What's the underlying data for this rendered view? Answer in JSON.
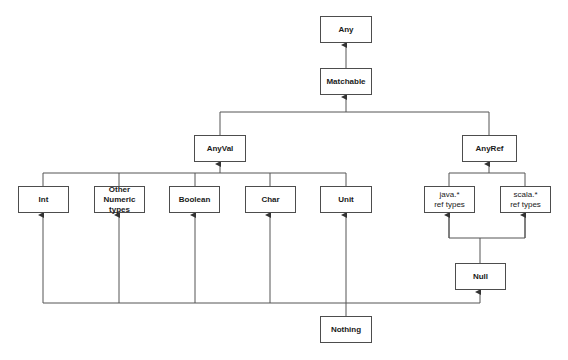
{
  "diagram": {
    "colors": {
      "line": "#555555",
      "border": "#4d4d4d",
      "text": "#1a1a1a",
      "background": "#ffffff"
    },
    "nodes": {
      "any": {
        "label": "Any",
        "x": 320,
        "y": 16,
        "w": 52,
        "h": 27
      },
      "matchable": {
        "label": "Matchable",
        "x": 320,
        "y": 68,
        "w": 52,
        "h": 27
      },
      "anyval": {
        "label": "AnyVal",
        "x": 194,
        "y": 135,
        "w": 52,
        "h": 27
      },
      "anyref": {
        "label": "AnyRef",
        "x": 462,
        "y": 135,
        "w": 55,
        "h": 27
      },
      "int": {
        "label": "Int",
        "x": 18,
        "y": 186,
        "w": 51,
        "h": 27
      },
      "other_numeric": {
        "label": "Other\nNumeric\ntypes",
        "x": 94,
        "y": 186,
        "w": 51,
        "h": 27
      },
      "boolean": {
        "label": "Boolean",
        "x": 169,
        "y": 186,
        "w": 51,
        "h": 27
      },
      "char": {
        "label": "Char",
        "x": 245,
        "y": 186,
        "w": 51,
        "h": 27
      },
      "unit": {
        "label": "Unit",
        "x": 320,
        "y": 186,
        "w": 52,
        "h": 27
      },
      "java_ref": {
        "label": "java.*\nref types",
        "x": 424,
        "y": 186,
        "w": 51,
        "h": 27
      },
      "scala_ref": {
        "label": "scala.*\nref types",
        "x": 500,
        "y": 186,
        "w": 51,
        "h": 27
      },
      "null": {
        "label": "Null",
        "x": 455,
        "y": 263,
        "w": 51,
        "h": 27
      },
      "nothing": {
        "label": "Nothing",
        "x": 320,
        "y": 316,
        "w": 52,
        "h": 27
      }
    },
    "edges": [
      {
        "from": "Matchable",
        "to": "Any"
      },
      {
        "from": "AnyVal",
        "to": "Matchable"
      },
      {
        "from": "AnyRef",
        "to": "Matchable"
      },
      {
        "from": "Int",
        "to": "AnyVal"
      },
      {
        "from": "Other Numeric types",
        "to": "AnyVal"
      },
      {
        "from": "Boolean",
        "to": "AnyVal"
      },
      {
        "from": "Char",
        "to": "AnyVal"
      },
      {
        "from": "Unit",
        "to": "AnyVal"
      },
      {
        "from": "java.* ref types",
        "to": "AnyRef"
      },
      {
        "from": "scala.* ref types",
        "to": "AnyRef"
      },
      {
        "from": "Null",
        "to": "java.* ref types"
      },
      {
        "from": "Null",
        "to": "scala.* ref types"
      },
      {
        "from": "Nothing",
        "to": "Int"
      },
      {
        "from": "Nothing",
        "to": "Other Numeric types"
      },
      {
        "from": "Nothing",
        "to": "Boolean"
      },
      {
        "from": "Nothing",
        "to": "Char"
      },
      {
        "from": "Nothing",
        "to": "Unit"
      },
      {
        "from": "Nothing",
        "to": "Null"
      }
    ]
  }
}
